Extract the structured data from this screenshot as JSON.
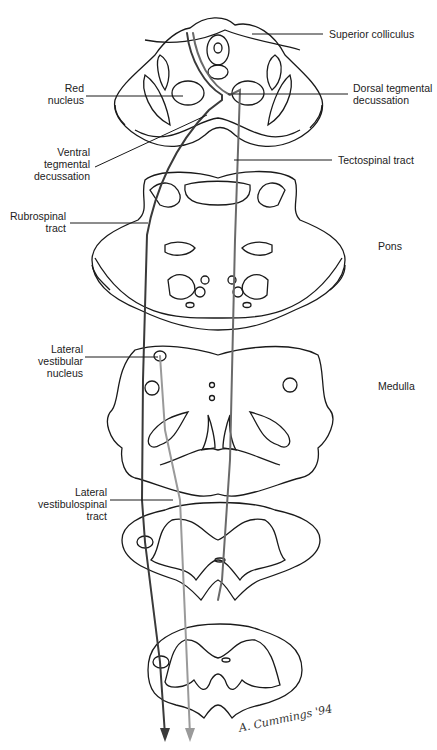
{
  "figure": {
    "type": "anatomical-diagram"
  },
  "labels": {
    "superior_colliculus": "Superior colliculus",
    "red_nucleus": "Red nucleus",
    "dorsal_tegmental_decussation": "Dorsal tegmental decussation",
    "ventral_tegmental_decussation": "Ventral tegmental decussation",
    "tectospinal_tract": "Tectospinal tract",
    "rubrospinal_tract": "Rubrospinal tract",
    "pons": "Pons",
    "lateral_vestibular_nucleus": "Lateral vestibular nucleus",
    "medulla": "Medulla",
    "lateral_vestibulospinal_tract": "Lateral vestibulospinal tract"
  },
  "label_lines": {
    "red_nucleus": [
      "Red",
      "nucleus"
    ],
    "dorsal_tegmental_decussation": [
      "Dorsal tegmental",
      "decussation"
    ],
    "ventral_tegmental_decussation": [
      "Ventral",
      "tegmental",
      "decussation"
    ],
    "rubrospinal_tract": [
      "Rubrospinal",
      "tract"
    ],
    "lateral_vestibular_nucleus": [
      "Lateral",
      "vestibular",
      "nucleus"
    ],
    "lateral_vestibulospinal_tract": [
      "Lateral",
      "vestibulospinal",
      "tract"
    ]
  },
  "signature": "A. Cummings '94",
  "colors": {
    "outline": "#1a1a1a",
    "tract_dark": "#3a3a3a",
    "tract_light": "#9a9a9a"
  }
}
